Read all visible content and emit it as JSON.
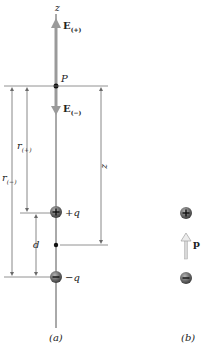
{
  "figure": {
    "panel_a": {
      "caption": "(a)",
      "axis_label": "z",
      "point_label": "P",
      "field_up_label": "E",
      "field_up_sub": "(+)",
      "field_down_label": "E",
      "field_down_sub": "(−)",
      "r_plus_label": "r",
      "r_plus_sub": "(+)",
      "r_minus_label": "r",
      "r_minus_sub": "(−)",
      "distance_label": "z",
      "separation_label": "d",
      "positive_charge_label": "+q",
      "negative_charge_label": "−q"
    },
    "panel_b": {
      "caption": "(b)",
      "dipole_moment_label": "p"
    },
    "colors": {
      "line": "#555555",
      "field_arrow": "#9a9a9a",
      "dimension_line": "#6a6a6a",
      "charge_fill": "#5a5a5a",
      "dipole_arrow": "#c8c8c8"
    }
  }
}
